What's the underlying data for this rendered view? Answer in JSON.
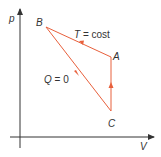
{
  "diagram": {
    "axes": {
      "y_label": "p",
      "x_label": "V"
    },
    "points": [
      {
        "name": "A",
        "label": "A"
      },
      {
        "name": "B",
        "label": "B"
      },
      {
        "name": "C",
        "label": "C"
      }
    ],
    "processes": [
      {
        "from": "A",
        "to": "B",
        "label_var": "T",
        "label_rest": " = cost",
        "type": "isothermal"
      },
      {
        "from": "B",
        "to": "C",
        "label_var": "Q",
        "label_rest": " = 0",
        "type": "adiabatic"
      },
      {
        "from": "C",
        "to": "A",
        "label_var": "",
        "label_rest": "",
        "type": "isochoric"
      }
    ],
    "colors": {
      "axis": "#333333",
      "cycle": "#e8603c",
      "text": "#333333"
    }
  }
}
